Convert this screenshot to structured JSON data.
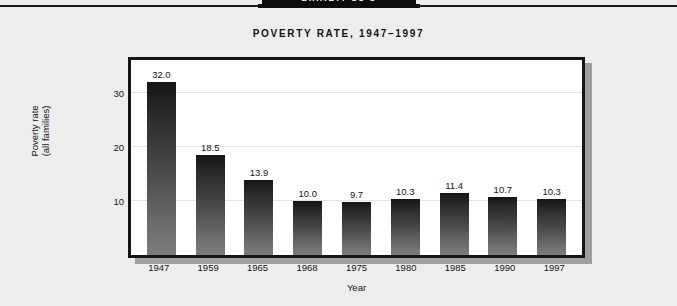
{
  "banner": {
    "label": "EXHIBIT 21-1"
  },
  "chart_data": {
    "type": "bar",
    "title": "POVERTY RATE, 1947–1997",
    "xlabel": "Year",
    "ylabel": "Poverty rate\n(all families)",
    "categories": [
      "1947",
      "1959",
      "1965",
      "1968",
      "1975",
      "1980",
      "1985",
      "1990",
      "1997"
    ],
    "values": [
      32.0,
      18.5,
      13.9,
      10.0,
      9.7,
      10.3,
      11.4,
      10.7,
      10.3
    ],
    "value_labels": [
      "32.0",
      "18.5",
      "13.9",
      "10.0",
      "9.7",
      "10.3",
      "11.4",
      "10.7",
      "10.3"
    ],
    "ylim": [
      0,
      36
    ],
    "yticks": [
      10,
      20,
      30
    ],
    "ytick_labels": [
      "10",
      "20",
      "30"
    ],
    "grid": true,
    "legend": false,
    "bar_color_top": "#141414",
    "bar_color_bottom": "#7d7d7d",
    "frame_color": "#161616",
    "shadow_color": "#9f9f9f",
    "plot_background": "#ffffff",
    "page_background": "#ededed"
  }
}
